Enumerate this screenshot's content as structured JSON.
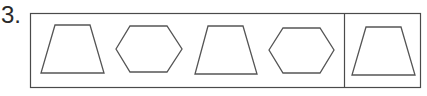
{
  "question": {
    "number_label": "3.",
    "sequence": [
      {
        "shape": "trapezoid",
        "points": "55,25 90,25 104,73 41,73"
      },
      {
        "shape": "hexagon",
        "points": "116,49 130,26 167,26 182,49 167,72 130,72"
      },
      {
        "shape": "trapezoid",
        "points": "208,26 243,26 257,74 195,74"
      },
      {
        "shape": "hexagon",
        "points": "269,50 283,28 320,28 334,50 320,73 283,73"
      }
    ],
    "answer_slot": [
      {
        "shape": "trapezoid",
        "points": "366,27 401,27 415,75 352,75"
      }
    ]
  },
  "colors": {
    "stroke": "#555555",
    "frame": "#4a4a4a",
    "background": "#ffffff"
  }
}
